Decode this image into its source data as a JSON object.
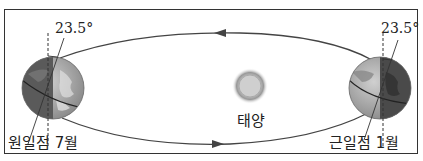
{
  "diagram": {
    "left_earth": {
      "label": "원일점 7월",
      "tilt_angle": "23.5°"
    },
    "right_earth": {
      "label": "근일점 1월",
      "tilt_angle": "23.5°"
    },
    "sun": {
      "label": "태양"
    },
    "orbit": {
      "direction": "counterclockwise",
      "top_arrow": "left",
      "bottom_arrow": "right"
    }
  },
  "colors": {
    "border": "#333333",
    "orbit_line": "#444444",
    "earth_dark": "#555555",
    "earth_light": "#b5b5b5",
    "sun_core": "#c8c8c8",
    "sun_glow": "#9a9a9a"
  }
}
